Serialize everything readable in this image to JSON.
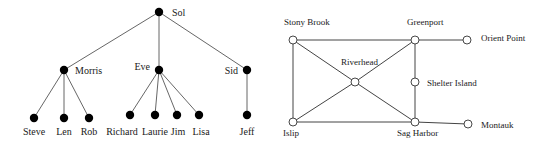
{
  "tree": {
    "nodes": [
      {
        "id": "sol",
        "label": "Sol",
        "x": 159,
        "y": 12,
        "lx": 172,
        "ly": 16,
        "anchor": "start"
      },
      {
        "id": "morris",
        "label": "Morris",
        "x": 64,
        "y": 70,
        "lx": 75,
        "ly": 74,
        "anchor": "start"
      },
      {
        "id": "eve",
        "label": "Eve",
        "x": 159,
        "y": 70,
        "lx": 150,
        "ly": 70,
        "anchor": "end"
      },
      {
        "id": "sid",
        "label": "Sid",
        "x": 247,
        "y": 70,
        "lx": 238,
        "ly": 74,
        "anchor": "end"
      },
      {
        "id": "steve",
        "label": "Steve",
        "x": 34,
        "y": 118,
        "lx": 34,
        "ly": 135,
        "anchor": "middle"
      },
      {
        "id": "len",
        "label": "Len",
        "x": 64,
        "y": 118,
        "lx": 64,
        "ly": 135,
        "anchor": "middle"
      },
      {
        "id": "rob",
        "label": "Rob",
        "x": 89,
        "y": 118,
        "lx": 89,
        "ly": 135,
        "anchor": "middle"
      },
      {
        "id": "richard",
        "label": "Richard",
        "x": 130,
        "y": 115,
        "lx": 122,
        "ly": 135,
        "anchor": "middle"
      },
      {
        "id": "laurie",
        "label": "Laurie",
        "x": 155,
        "y": 115,
        "lx": 155,
        "ly": 135,
        "anchor": "middle"
      },
      {
        "id": "jim",
        "label": "Jim",
        "x": 177,
        "y": 115,
        "lx": 178,
        "ly": 135,
        "anchor": "middle"
      },
      {
        "id": "lisa",
        "label": "Lisa",
        "x": 199,
        "y": 115,
        "lx": 201,
        "ly": 135,
        "anchor": "middle"
      },
      {
        "id": "jeff",
        "label": "Jeff",
        "x": 247,
        "y": 115,
        "lx": 247,
        "ly": 135,
        "anchor": "middle"
      }
    ],
    "edges": [
      [
        "sol",
        "morris"
      ],
      [
        "sol",
        "eve"
      ],
      [
        "sol",
        "sid"
      ],
      [
        "morris",
        "steve"
      ],
      [
        "morris",
        "len"
      ],
      [
        "morris",
        "rob"
      ],
      [
        "eve",
        "richard"
      ],
      [
        "eve",
        "laurie"
      ],
      [
        "eve",
        "jim"
      ],
      [
        "eve",
        "lisa"
      ],
      [
        "sid",
        "jeff"
      ]
    ]
  },
  "graph": {
    "nodes": [
      {
        "id": "stony_brook",
        "label": "Stony Brook",
        "x": 293,
        "y": 40,
        "lx": 284,
        "ly": 25,
        "anchor": "start"
      },
      {
        "id": "greenport",
        "label": "Greenport",
        "x": 415,
        "y": 40,
        "lx": 407,
        "ly": 25,
        "anchor": "start"
      },
      {
        "id": "orient_point",
        "label": "Orient Point",
        "x": 467,
        "y": 40,
        "lx": 481,
        "ly": 41,
        "anchor": "start"
      },
      {
        "id": "riverhead",
        "label": "Riverhead",
        "x": 355,
        "y": 82,
        "lx": 341,
        "ly": 65,
        "anchor": "start"
      },
      {
        "id": "shelter_island",
        "label": "Shelter Island",
        "x": 415,
        "y": 82,
        "lx": 427,
        "ly": 86,
        "anchor": "start"
      },
      {
        "id": "islip",
        "label": "Islip",
        "x": 293,
        "y": 122,
        "lx": 283,
        "ly": 136,
        "anchor": "start"
      },
      {
        "id": "sag_harbor",
        "label": "Sag Harbor",
        "x": 415,
        "y": 122,
        "lx": 397,
        "ly": 136,
        "anchor": "start"
      },
      {
        "id": "montauk",
        "label": "Montauk",
        "x": 468,
        "y": 124,
        "lx": 481,
        "ly": 128,
        "anchor": "start"
      }
    ],
    "edges": [
      [
        "stony_brook",
        "greenport"
      ],
      [
        "greenport",
        "orient_point"
      ],
      [
        "stony_brook",
        "islip"
      ],
      [
        "islip",
        "sag_harbor"
      ],
      [
        "sag_harbor",
        "montauk"
      ],
      [
        "greenport",
        "shelter_island"
      ],
      [
        "shelter_island",
        "sag_harbor"
      ],
      [
        "stony_brook",
        "riverhead"
      ],
      [
        "riverhead",
        "sag_harbor"
      ],
      [
        "islip",
        "riverhead"
      ],
      [
        "riverhead",
        "greenport"
      ]
    ]
  }
}
